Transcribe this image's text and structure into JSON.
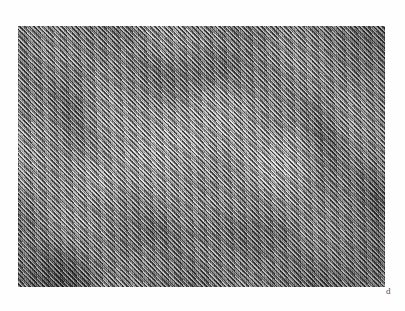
{
  "figure": {
    "kind": "grayscale-micrograph-panel",
    "panel_label": "d",
    "background_color": "#ffffff",
    "image_region": {
      "x": 18,
      "y": 26,
      "width": 367,
      "height": 261
    },
    "appearance": {
      "description": "Dense fine diagonal hatching forming a moire interference pattern over nested rectangular light and dark regions",
      "dominant_tone": "#a2a2a2",
      "darkest_tone": "#1e1e1e",
      "lightest_tone": "#e6e6e6",
      "hatch_angle_degrees": 47,
      "hatch_pitch_px": 2.3,
      "secondary_hatch_angle_degrees": 43.5,
      "counter_hatch_angle_degrees": -45
    },
    "structures": [
      {
        "name": "central-bright-box",
        "tone": "light",
        "cx": 205,
        "cy": 150
      },
      {
        "name": "upper-dark-band",
        "tone": "dark",
        "cx": 215,
        "cy": 92
      },
      {
        "name": "lower-dark-band",
        "tone": "dark",
        "cx": 225,
        "cy": 248
      },
      {
        "name": "left-dark-column",
        "tone": "dark",
        "cx": 98,
        "cy": 120
      },
      {
        "name": "right-dark-column",
        "tone": "dark",
        "cx": 345,
        "cy": 150
      },
      {
        "name": "left-bright-patch",
        "tone": "light",
        "cx": 120,
        "cy": 190
      },
      {
        "name": "right-bright-patch",
        "tone": "light",
        "cx": 300,
        "cy": 175
      }
    ]
  }
}
